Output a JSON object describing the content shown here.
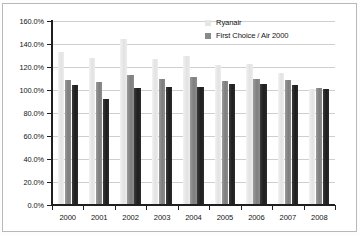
{
  "chart_data": {
    "type": "bar",
    "title": "",
    "xlabel": "",
    "ylabel": "",
    "categories": [
      "2000",
      "2001",
      "2002",
      "2003",
      "2004",
      "2005",
      "2006",
      "2007",
      "2008"
    ],
    "ylim": [
      0,
      160
    ],
    "ytick_values": [
      0,
      20,
      40,
      60,
      80,
      100,
      120,
      140,
      160
    ],
    "ytick_labels": [
      "0.0%",
      "20.0%",
      "40.0%",
      "60.0%",
      "80.0%",
      "100.0%",
      "120.0%",
      "140.0%",
      "160.0%"
    ],
    "grid": true,
    "legend_position": "top-right",
    "series": [
      {
        "name": "",
        "color": "#e8e8e8",
        "values": [
          133.0,
          128.0,
          144.0,
          127.0,
          130.0,
          122.0,
          123.0,
          115.0,
          101.0
        ]
      },
      {
        "name": "Ryanair",
        "color": "#8a8a8a",
        "values": [
          109.0,
          107.0,
          113.0,
          110.0,
          111.0,
          108.0,
          110.0,
          109.0,
          102.0
        ]
      },
      {
        "name": "First Choice / Air 2000",
        "color": "#262626",
        "values": [
          104.0,
          92.0,
          102.0,
          103.0,
          103.0,
          105.0,
          105.0,
          104.0,
          101.0
        ]
      }
    ]
  },
  "legend": {
    "entries": [
      {
        "label": "Ryanair",
        "swatch": "light-gray-swatch"
      },
      {
        "label": "First Choice / Air 2000",
        "swatch": "dark-gray-swatch"
      }
    ]
  }
}
